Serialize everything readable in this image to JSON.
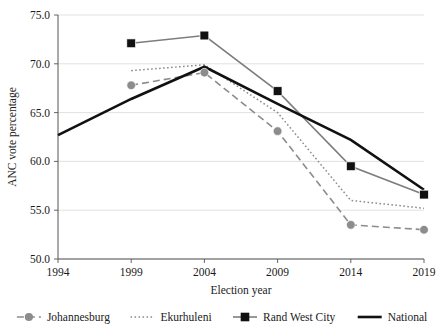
{
  "chart_data": {
    "type": "line",
    "title": "",
    "xlabel": "Election year",
    "ylabel": "ANC vote percentage",
    "x": [
      1994,
      1999,
      2004,
      2009,
      2014,
      2019
    ],
    "xticklabels": [
      "1994",
      "1999",
      "2004",
      "2009",
      "2014",
      "2019"
    ],
    "yticklabels": [
      "50.0",
      "55.0",
      "60.0",
      "65.0",
      "70.0",
      "75.0"
    ],
    "yticks": [
      50.0,
      55.0,
      60.0,
      65.0,
      70.0,
      75.0
    ],
    "ylim": [
      50.0,
      75.0
    ],
    "grid": "horizontal",
    "legend_position": "bottom",
    "series": [
      {
        "name": "Johannesburg",
        "style": "dashed",
        "marker": "circle",
        "color": "#8c8c8c",
        "x": [
          1999,
          2004,
          2009,
          2014,
          2019
        ],
        "values": [
          67.8,
          69.1,
          63.1,
          53.5,
          53.0
        ]
      },
      {
        "name": "Ekurhuleni",
        "style": "dotted",
        "marker": "none",
        "color": "#8c8c8c",
        "x": [
          1999,
          2004,
          2009,
          2014,
          2019
        ],
        "values": [
          69.3,
          69.9,
          65.0,
          56.0,
          55.2
        ]
      },
      {
        "name": "Rand West City",
        "style": "solid",
        "marker": "square",
        "color": "#7d7d7d",
        "marker_color": "#111111",
        "x": [
          1999,
          2004,
          2009,
          2014,
          2019
        ],
        "values": [
          72.1,
          72.9,
          67.2,
          59.5,
          56.6
        ]
      },
      {
        "name": "National",
        "style": "solid-thick",
        "marker": "none",
        "color": "#111111",
        "x": [
          1994,
          1999,
          2004,
          2009,
          2014,
          2019
        ],
        "values": [
          62.7,
          66.4,
          69.7,
          65.9,
          62.2,
          57.1
        ]
      }
    ]
  }
}
